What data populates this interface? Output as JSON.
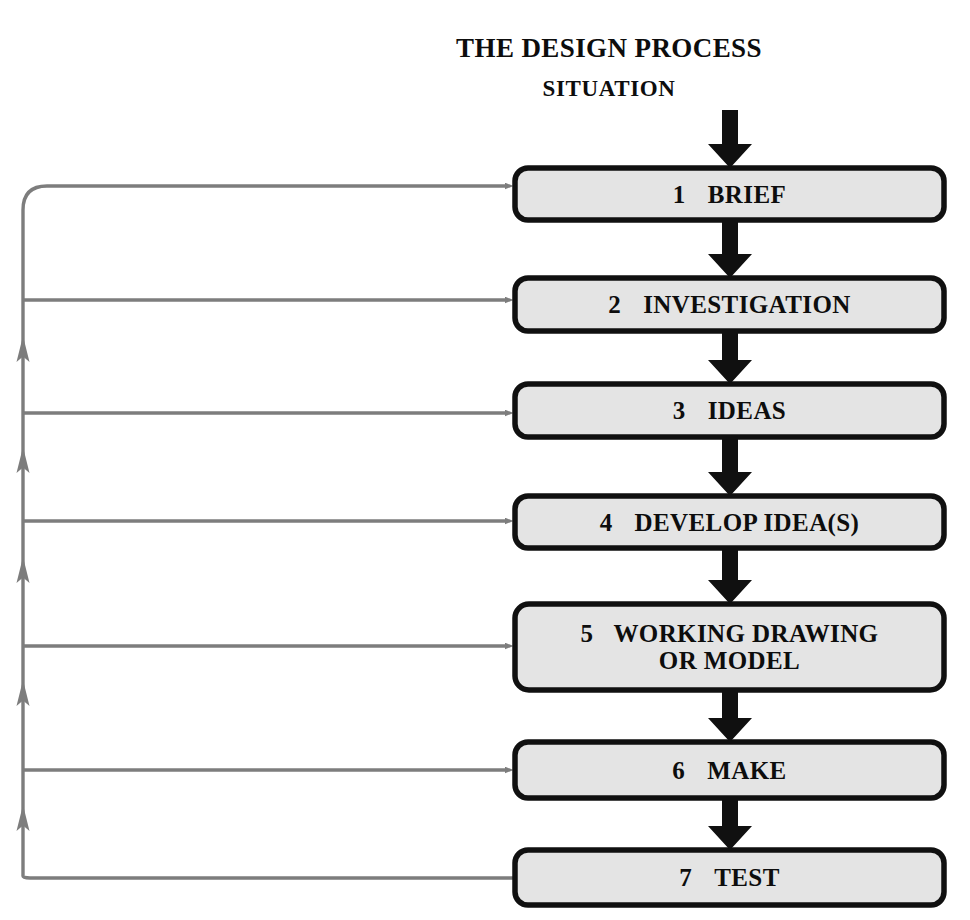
{
  "diagram": {
    "title": "THE DESIGN PROCESS",
    "input_label": "SITUATION",
    "type": "flowchart",
    "orientation": "vertical",
    "colors": {
      "box_fill": "#e4e4e4",
      "box_border": "#101010",
      "flow_arrow": "#101010",
      "feedback_arrow": "#7d7d7d",
      "text": "#0d0d0d",
      "background": "#ffffff"
    },
    "steps": [
      {
        "number": "1",
        "label": "BRIEF",
        "lines": [
          "BRIEF"
        ]
      },
      {
        "number": "2",
        "label": "INVESTIGATION",
        "lines": [
          "INVESTIGATION"
        ]
      },
      {
        "number": "3",
        "label": "IDEAS",
        "lines": [
          "IDEAS"
        ]
      },
      {
        "number": "4",
        "label": "DEVELOP IDEA(S)",
        "lines": [
          "DEVELOP IDEA(S)"
        ]
      },
      {
        "number": "5",
        "label": "WORKING DRAWING OR MODEL",
        "lines": [
          "WORKING DRAWING",
          "OR MODEL"
        ]
      },
      {
        "number": "6",
        "label": "MAKE",
        "lines": [
          "MAKE"
        ]
      },
      {
        "number": "7",
        "label": "TEST",
        "lines": [
          "TEST"
        ]
      }
    ],
    "flow_arrows": [
      {
        "from": "SITUATION",
        "to": "1 BRIEF"
      },
      {
        "from": "1 BRIEF",
        "to": "2 INVESTIGATION"
      },
      {
        "from": "2 INVESTIGATION",
        "to": "3 IDEAS"
      },
      {
        "from": "3 IDEAS",
        "to": "4 DEVELOP IDEA(S)"
      },
      {
        "from": "4 DEVELOP IDEA(S)",
        "to": "5 WORKING DRAWING OR MODEL"
      },
      {
        "from": "5 WORKING DRAWING OR MODEL",
        "to": "6 MAKE"
      },
      {
        "from": "6 MAKE",
        "to": "7 TEST"
      }
    ],
    "feedback_arrows": [
      {
        "from": "7 TEST",
        "to": "1 BRIEF"
      },
      {
        "from": "7 TEST",
        "to": "2 INVESTIGATION"
      },
      {
        "from": "7 TEST",
        "to": "3 IDEAS"
      },
      {
        "from": "7 TEST",
        "to": "4 DEVELOP IDEA(S)"
      },
      {
        "from": "7 TEST",
        "to": "5 WORKING DRAWING OR MODEL"
      },
      {
        "from": "7 TEST",
        "to": "6 MAKE"
      }
    ]
  }
}
